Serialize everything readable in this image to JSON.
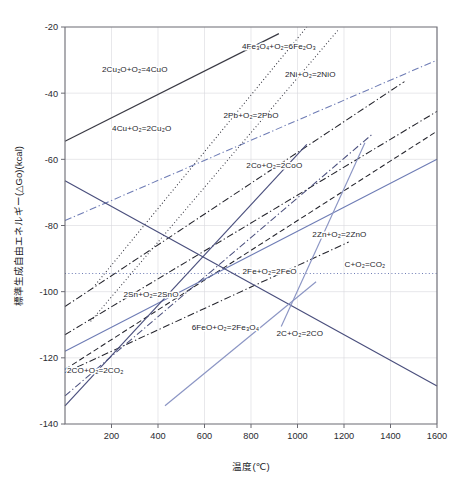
{
  "chart_data": {
    "type": "line",
    "title": "",
    "xlabel": "温度(℃)",
    "ylabel": "標準生成自由エネルギー(△Go)(kcal)",
    "xlim": [
      0,
      1600
    ],
    "ylim": [
      -140,
      -20
    ],
    "xticks": [
      200,
      400,
      600,
      800,
      1000,
      1200,
      1400,
      1600
    ],
    "yticks": [
      -20,
      -40,
      -60,
      -80,
      -100,
      -120,
      -140
    ],
    "grid": true,
    "legend_position": "inline-annotations",
    "series": [
      {
        "name": "2Cu2O+O2=4CuO",
        "label": "2Cu₂O+O₂=4CuO",
        "color": "#3a3a44",
        "style": "solid",
        "label_x": 300,
        "label_y": -33.5,
        "x": [
          0,
          920
        ],
        "y": [
          -54.5,
          -22.0
        ]
      },
      {
        "name": "4Fe3O4+O2=6Fe2O3",
        "label": "4Fe₃O₄+O₂=6Fe₂O₃",
        "color": "#2f2f39",
        "style": "dotted",
        "label_x": 920,
        "label_y": -26.5,
        "x": [
          130,
          1040
        ],
        "y": [
          -98.0,
          -20.0
        ]
      },
      {
        "name": "4Cu+O2=2Cu2O",
        "label": "4Cu+O₂=2Cu₂O",
        "color": "#6e7cb5",
        "style": "dashdot",
        "label_x": 330,
        "label_y": -51.5,
        "x": [
          0,
          1600
        ],
        "y": [
          -78.5,
          -30.0
        ]
      },
      {
        "name": "2Ni+O2=2NiO",
        "label": "2Ni+O₂=2NiO",
        "color": "#24242c",
        "style": "dashdot",
        "label_x": 1055,
        "label_y": -35.0,
        "x": [
          0,
          1460
        ],
        "y": [
          -104.5,
          -36.5
        ]
      },
      {
        "name": "2Pb+O2=2PbO",
        "label": "2Pb+O₂=2PbO",
        "color": "#3a3a44",
        "style": "dotted",
        "label_x": 800,
        "label_y": -47.5,
        "x": [
          110,
          1180
        ],
        "y": [
          -109.0,
          -20.5
        ]
      },
      {
        "name": "2Co+O2=2CoO",
        "label": "2Co+O₂=2CoO",
        "color": "#24242c",
        "style": "dashdot",
        "label_x": 900,
        "label_y": -62.5,
        "x": [
          0,
          1600
        ],
        "y": [
          -113.0,
          -45.5
        ]
      },
      {
        "name": "2Zn+O2=2ZnO",
        "label": "2Zn+O₂=2ZnO",
        "color": "#24242c",
        "style": "dashdot",
        "label_x": 1180,
        "label_y": -83.5,
        "x": [
          0,
          1220
        ],
        "y": [
          -124.5,
          -85.0
        ]
      },
      {
        "name": "2Fe+O2=2FeO",
        "label": "2Fe+O₂=2FeO",
        "color": "#24242c",
        "style": "dashed",
        "label_x": 880,
        "label_y": -94.5,
        "x": [
          0,
          1600
        ],
        "y": [
          -123.5,
          -51.5
        ]
      },
      {
        "name": "C+O2=CO2",
        "label": "C+O₂=CO₂",
        "color": "#6e7cb5",
        "style": "dotted",
        "label_x": 1290,
        "label_y": -92.5,
        "x": [
          0,
          1600
        ],
        "y": [
          -94.5,
          -94.5
        ]
      },
      {
        "name": "2Sn+O2=2SnO",
        "label": "2Sn+O₂=2SnO",
        "color": "#6e7cb5",
        "style": "solid",
        "label_x": 370,
        "label_y": -101.5,
        "x": [
          0,
          1600
        ],
        "y": [
          -118.0,
          -60.0
        ]
      },
      {
        "name": "6FeO+O2=2Fe3O4",
        "label": "6FeO+O₂=2Fe₃O₄",
        "color": "#4a4f7d",
        "style": "dashdot",
        "label_x": 690,
        "label_y": -111.5,
        "x": [
          0,
          1320
        ],
        "y": [
          -131.5,
          -52.5
        ]
      },
      {
        "name": "2CO+O2=2CO2",
        "label": "2CO+O₂=2CO₂",
        "color": "#4a4f7d",
        "style": "solid",
        "label_x": 130,
        "label_y": -124.5,
        "x": [
          0,
          1040
        ],
        "y": [
          -134.5,
          -55.5
        ]
      },
      {
        "name": "2C+O2=2CO",
        "label": "2C+O₂=2CO",
        "color": "#4a4f7d",
        "style": "solid",
        "label_x": 1010,
        "label_y": -113.5,
        "x": [
          0,
          1600
        ],
        "y": [
          -66.5,
          -128.5
        ]
      },
      {
        "name": "2Mn-unlabelled-blue-lower",
        "label": "",
        "color": "#8b95c4",
        "style": "solid",
        "label_x": null,
        "label_y": null,
        "x": [
          430,
          1080
        ],
        "y": [
          -134.5,
          -97.0
        ]
      },
      {
        "name": "unlabelled-blue-upper-right",
        "label": "",
        "color": "#8b95c4",
        "style": "solid",
        "label_x": null,
        "label_y": null,
        "x": [
          930,
          1290
        ],
        "y": [
          -110.5,
          -55.0
        ]
      }
    ]
  },
  "axes": {
    "x_tick_labels": [
      "200",
      "400",
      "600",
      "800",
      "1000",
      "1200",
      "1400",
      "1600"
    ],
    "y_tick_labels": [
      "-20",
      "-40",
      "-60",
      "-80",
      "-100",
      "-120",
      "-140"
    ],
    "x_title": "温度(℃)",
    "y_title": "標準生成自由エネルギー(△Go)(kcal)"
  },
  "colors": {
    "blue": "#6e7cb5",
    "dark_blue": "#4a4f7d",
    "light_blue": "#8b95c4",
    "black": "#24242c",
    "grid": "#d8d8de",
    "axis": "#6b6b73"
  }
}
